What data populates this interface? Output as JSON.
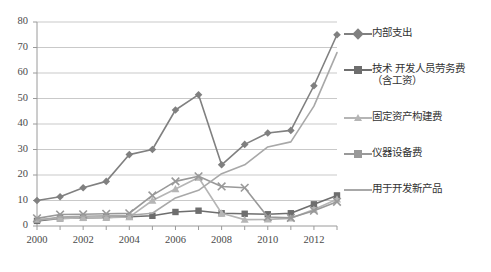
{
  "chart_data": {
    "type": "line",
    "title": "",
    "xlabel": "",
    "ylabel": "",
    "ylim": [
      0,
      80
    ],
    "ytick_step": 10,
    "grid": true,
    "legend_position": "right",
    "x": [
      2000,
      2001,
      2002,
      2003,
      2004,
      2005,
      2006,
      2007,
      2008,
      2009,
      2010,
      2011,
      2012,
      2013
    ],
    "xtick_labels": [
      "2000",
      "2002",
      "2004",
      "2006",
      "2008",
      "2010",
      "2012"
    ],
    "ytick_labels": [
      "0",
      "10",
      "20",
      "30",
      "40",
      "50",
      "60",
      "70",
      "80"
    ],
    "series": [
      {
        "name": "内部支出",
        "marker": "diamond",
        "color": "#808080",
        "values": [
          10.0,
          11.5,
          15.0,
          17.5,
          28.0,
          30.0,
          45.5,
          51.5,
          24.0,
          32.0,
          36.5,
          37.5,
          55.0,
          75.0
        ]
      },
      {
        "name": "技术 开发人员劳务费（含工资）",
        "marker": "square",
        "color": "#6e6e6e",
        "values": [
          2.0,
          3.0,
          3.2,
          3.4,
          3.6,
          4.0,
          5.5,
          6.0,
          5.0,
          4.8,
          4.6,
          5.0,
          8.5,
          12.0
        ]
      },
      {
        "name": "固定资产构建费",
        "marker": "triangle",
        "color": "#b5b5b5",
        "values": [
          2.5,
          3.0,
          3.2,
          3.3,
          3.5,
          10.0,
          14.5,
          19.0,
          5.0,
          2.5,
          2.6,
          3.0,
          6.5,
          10.5
        ]
      },
      {
        "name": "仪器设备费",
        "marker": "x",
        "color": "#999999",
        "values": [
          3.0,
          4.5,
          4.6,
          4.8,
          5.0,
          12.0,
          17.5,
          19.5,
          15.5,
          15.0,
          3.5,
          3.2,
          6.0,
          9.5
        ]
      },
      {
        "name": "用于开发新产品",
        "marker": "none",
        "color": "#a8a8a8",
        "values": [
          2.2,
          3.5,
          3.8,
          4.0,
          4.2,
          5.0,
          11.0,
          14.0,
          20.5,
          24.0,
          31.0,
          33.0,
          47.0,
          68.0
        ]
      }
    ]
  },
  "legend": {
    "items": [
      {
        "label": "内部支出",
        "label2": ""
      },
      {
        "label": "技术 开发人员劳务费",
        "label2": "（含工资）"
      },
      {
        "label": "固定资产构建费",
        "label2": ""
      },
      {
        "label": "仪器设备费",
        "label2": ""
      },
      {
        "label": "用于开发新产品",
        "label2": ""
      }
    ]
  }
}
